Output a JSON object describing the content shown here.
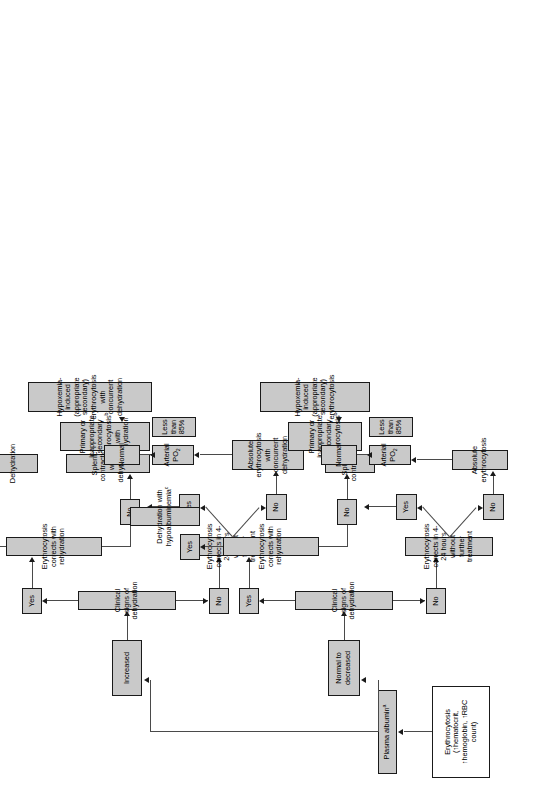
{
  "figure": {
    "orientation": "rotated-90-ccw",
    "box_fill_color": "#c9c9c9",
    "box_border_color": "#1a1a1a",
    "connector_color": "#4a4a4a",
    "background_color": "#ffffff"
  },
  "nodes": {
    "start": "Erythrocytosis (↑hematocrit, ↑hemoglobin, ↑RBC count)",
    "plasma_albumin": "Plasma albumin",
    "plasma_albumin_sup": "a",
    "increased": "Increased",
    "normal_to_decreased": "Normal to decreased",
    "top": {
      "clinical_signs": "Clinical signs of dehydration",
      "yes_1": "Yes",
      "no_1": "No",
      "corrects_rehydration": "Erythrocytosis corrects with rehydration",
      "corrects_4_24": "Erythrocytosis corrects in 4-24 hours without further treatment",
      "yes_2": "Yes",
      "no_2": "No",
      "yes_3": "Yes",
      "no_3": "No",
      "dehydration": "Dehydration",
      "splenic_contraction": "Splenic contraction with dehydration",
      "primary_secondary": "Primary or inappropriate secondary erythrocytosis",
      "primary_secondary_sup": "b",
      "primary_secondary_tail": " with dehydration",
      "absolute_eryth": "Absolute erythrocytosis with concurrent dehydration",
      "arterial_po2": "Arterial PO",
      "arterial_po2_sub": "2",
      "normal": "Normal",
      "less_than_85": "Less than 85%",
      "hypoxemia": "Hypoxemia-induced (appropriate secondary) erythrocytosis with concurrent dehydration"
    },
    "bottom": {
      "clinical_signs": "Clinical signs of dehydration",
      "yes_1": "Yes",
      "no_1": "No",
      "corrects_rehydration": "Erythrocytosis corrects with rehydration",
      "corrects_4_24": "Erythrocytosis corrects in 4-24 hours without further treatment",
      "yes_2": "Yes",
      "no_2": "No",
      "yes_3": "Yes",
      "no_3": "No",
      "dehydration_hypo": "Dehydration with hypoalbuminemia",
      "dehydration_hypo_sup": "c",
      "splenic_contraction": "Splenic contraction",
      "primary_secondary": "Primary or inappropriate secondary erythrocytosis",
      "primary_secondary_sup": "b",
      "absolute_eryth": "Absolute erythrocytosis",
      "arterial_po2": "Arterial PO",
      "arterial_po2_sub": "2",
      "normal": "Normal",
      "less_than_85": "Less than 85%",
      "hypoxemia": "Hypoxemia-induced (appropriate secondary) erythrocytosis"
    }
  },
  "caption": {
    "line": ""
  }
}
